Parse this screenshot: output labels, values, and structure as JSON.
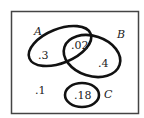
{
  "diagram": {
    "type": "venn",
    "sets": [
      {
        "name": "A",
        "label": "A"
      },
      {
        "name": "B",
        "label": "B"
      },
      {
        "name": "C",
        "label": "C"
      }
    ],
    "regions": {
      "A_only": ".3",
      "A_and_B": ".02",
      "B_only": ".4",
      "C_only": ".18",
      "outside": ".1"
    },
    "colors": {
      "stroke": "#111111",
      "frame": "#444444",
      "background": "#ffffff"
    }
  }
}
